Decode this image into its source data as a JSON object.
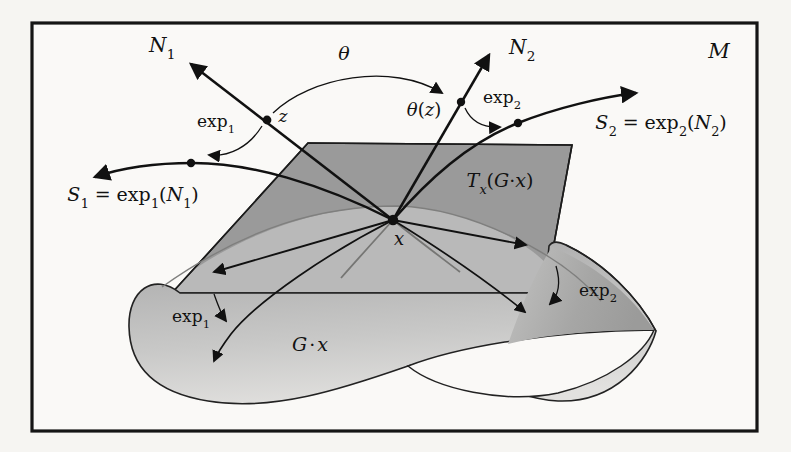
{
  "figure": {
    "type": "math-diagram",
    "colors": {
      "frame": "#151515",
      "plane_fill": "#9a9a9a",
      "plane_over_surface_fill": "#b9b9b9",
      "surface_light": "#e0e0e0",
      "surface_mid": "#b2b2b2",
      "curl_shade": "#9f9f9f",
      "line": "#111111",
      "gray_line": "#7a7a7a",
      "background": "#f6f5f2"
    }
  },
  "labels": {
    "manifold": "M",
    "theta": "θ",
    "theta_z": {
      "a": "θ",
      "open": "(",
      "b": "z",
      "close": ")"
    },
    "z": "z",
    "x": "x",
    "n1": {
      "main": "N",
      "sub": "1"
    },
    "n2": {
      "main": "N",
      "sub": "2"
    },
    "exp1": {
      "main": "exp",
      "sub": "1"
    },
    "exp2": {
      "main": "exp",
      "sub": "2"
    },
    "s1": {
      "a": "S",
      "asub": "1",
      "eq": "=",
      "exp": "exp",
      "expsub": "1",
      "open": "(",
      "n": "N",
      "nsub": "1",
      "close": ")"
    },
    "s2": {
      "a": "S",
      "asub": "2",
      "eq": "=",
      "exp": "exp",
      "expsub": "2",
      "open": "(",
      "n": "N",
      "nsub": "2",
      "close": ")"
    },
    "tangent": {
      "t": "T",
      "tsub": "x",
      "open": "(",
      "g": "G",
      "dot": "·",
      "x": "x",
      "close": ")"
    },
    "orbit": {
      "g": "G",
      "dot": "·",
      "x": "x"
    }
  }
}
